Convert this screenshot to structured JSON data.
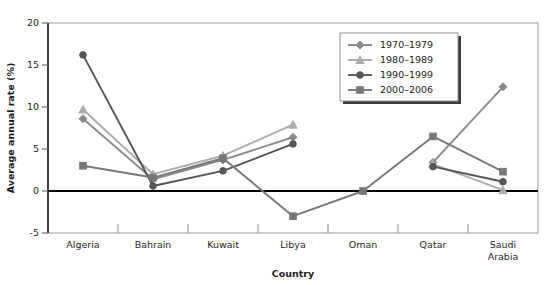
{
  "chart_data": {
    "type": "line",
    "title": "",
    "xlabel": "Country",
    "ylabel": "Average annual rate (%)",
    "categories": [
      "Algeria",
      "Bahrain",
      "Kuwait",
      "Libya",
      "Oman",
      "Qatar",
      "Saudi Arabia"
    ],
    "category_labels_wrapped": [
      [
        "Algeria"
      ],
      [
        "Bahrain"
      ],
      [
        "Kuwait"
      ],
      [
        "Libya"
      ],
      [
        "Oman"
      ],
      [
        "Qatar"
      ],
      [
        "Saudi",
        "Arabia"
      ]
    ],
    "ylim": [
      -5,
      20
    ],
    "yticks": [
      -5,
      0,
      5,
      10,
      15,
      20
    ],
    "ytick_labels": [
      "-5",
      "0",
      "5",
      "10",
      "15",
      "20"
    ],
    "grid": false,
    "zero_line": true,
    "legend_position": "top-right",
    "series": [
      {
        "name": "1970–1979",
        "marker": "diamond",
        "color": "#8a8a8a",
        "values": [
          8.6,
          1.4,
          3.7,
          6.4,
          null,
          3.4,
          12.4
        ],
        "connect_gaps": false
      },
      {
        "name": "1980–1989",
        "marker": "triangle",
        "color": "#ababab",
        "values": [
          9.7,
          2.0,
          4.2,
          7.9,
          null,
          3.2,
          0.1
        ],
        "connect_gaps": false
      },
      {
        "name": "1990–1999",
        "marker": "circle",
        "color": "#555555",
        "values": [
          16.2,
          0.6,
          2.4,
          5.6,
          null,
          2.9,
          1.1
        ],
        "connect_gaps": false
      },
      {
        "name": "2000–2006",
        "marker": "square",
        "color": "#777777",
        "values": [
          3.0,
          1.6,
          3.9,
          -3.0,
          0.0,
          6.5,
          2.3
        ],
        "connect_gaps": true
      }
    ]
  }
}
